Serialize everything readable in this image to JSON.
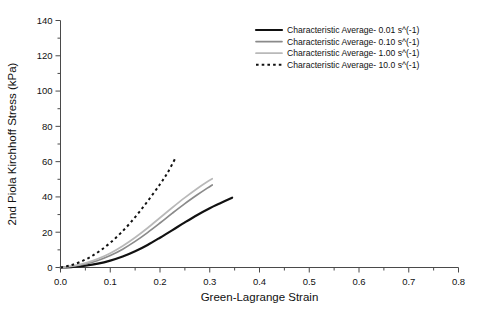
{
  "chart_data": {
    "type": "line",
    "title": "",
    "xlabel": "Green-Lagrange Strain",
    "ylabel": "2nd Piola Kirchhoff Stress (kPa)",
    "xlim": [
      0.0,
      0.8
    ],
    "ylim": [
      0,
      140
    ],
    "xticks": [
      "0.0",
      "0.1",
      "0.2",
      "0.3",
      "0.4",
      "0.5",
      "0.6",
      "0.7",
      "0.8"
    ],
    "xtick_values": [
      0.0,
      0.1,
      0.2,
      0.3,
      0.4,
      0.5,
      0.6,
      0.7,
      0.8
    ],
    "yticks": [
      "0",
      "20",
      "40",
      "60",
      "80",
      "100",
      "120",
      "140"
    ],
    "ytick_values": [
      0,
      20,
      40,
      60,
      80,
      100,
      120,
      140
    ],
    "minor_xtick_step": 0.05,
    "minor_ytick_step": 10,
    "grid": false,
    "legend_position": "top-right",
    "series": [
      {
        "name": "Characteristic Average- 0.01 s^(-1)",
        "color": "#111111",
        "style": "solid",
        "width": 2.2,
        "points": [
          [
            0.0,
            0.0
          ],
          [
            0.025,
            0.4
          ],
          [
            0.05,
            1.1
          ],
          [
            0.075,
            2.2
          ],
          [
            0.1,
            3.9
          ],
          [
            0.125,
            6.2
          ],
          [
            0.15,
            9.2
          ],
          [
            0.175,
            12.8
          ],
          [
            0.2,
            16.9
          ],
          [
            0.225,
            21.2
          ],
          [
            0.25,
            25.6
          ],
          [
            0.275,
            29.8
          ],
          [
            0.3,
            33.6
          ],
          [
            0.32,
            36.3
          ],
          [
            0.345,
            39.6
          ]
        ]
      },
      {
        "name": "Characteristic Average- 0.10 s^(-1)",
        "color": "#8a8a8a",
        "style": "solid",
        "width": 1.7,
        "points": [
          [
            0.0,
            0.0
          ],
          [
            0.025,
            0.7
          ],
          [
            0.05,
            2.0
          ],
          [
            0.075,
            4.0
          ],
          [
            0.1,
            6.8
          ],
          [
            0.125,
            10.4
          ],
          [
            0.15,
            14.8
          ],
          [
            0.175,
            19.8
          ],
          [
            0.2,
            25.2
          ],
          [
            0.225,
            30.8
          ],
          [
            0.25,
            36.2
          ],
          [
            0.275,
            41.2
          ],
          [
            0.295,
            45.0
          ],
          [
            0.305,
            46.8
          ]
        ]
      },
      {
        "name": "Characteristic Average- 1.00 s^(-1)",
        "color": "#b9b9b9",
        "style": "solid",
        "width": 1.7,
        "points": [
          [
            0.0,
            0.0
          ],
          [
            0.025,
            0.9
          ],
          [
            0.05,
            2.5
          ],
          [
            0.075,
            4.9
          ],
          [
            0.1,
            8.1
          ],
          [
            0.125,
            12.2
          ],
          [
            0.15,
            17.0
          ],
          [
            0.175,
            22.4
          ],
          [
            0.2,
            28.2
          ],
          [
            0.225,
            34.0
          ],
          [
            0.25,
            39.6
          ],
          [
            0.275,
            44.8
          ],
          [
            0.295,
            48.6
          ],
          [
            0.305,
            50.3
          ]
        ]
      },
      {
        "name": "Characteristic Average- 10.0 s^(-1)",
        "color": "#111111",
        "style": "dotted",
        "width": 2.0,
        "points": [
          [
            0.0,
            0.0
          ],
          [
            0.02,
            1.2
          ],
          [
            0.04,
            3.2
          ],
          [
            0.06,
            6.0
          ],
          [
            0.08,
            9.6
          ],
          [
            0.1,
            14.0
          ],
          [
            0.12,
            19.2
          ],
          [
            0.14,
            25.2
          ],
          [
            0.16,
            32.0
          ],
          [
            0.18,
            39.4
          ],
          [
            0.2,
            47.2
          ],
          [
            0.215,
            53.6
          ],
          [
            0.23,
            61.5
          ]
        ]
      }
    ]
  },
  "legend": {
    "entries": [
      {
        "label": "Characteristic Average- 0.01 s^(-1)"
      },
      {
        "label": "Characteristic Average- 0.10 s^(-1)"
      },
      {
        "label": "Characteristic Average- 1.00 s^(-1)"
      },
      {
        "label": "Characteristic Average- 10.0 s^(-1)"
      }
    ]
  }
}
